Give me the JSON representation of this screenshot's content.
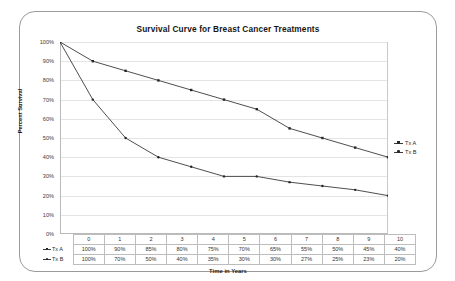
{
  "chart_data": {
    "type": "line",
    "title": "Survival Curve for Breast Cancer Treatments",
    "xlabel": "Time in Years",
    "ylabel": "Percent Survival",
    "categories": [
      "0",
      "1",
      "2",
      "3",
      "4",
      "5",
      "6",
      "7",
      "8",
      "9",
      "10"
    ],
    "x": [
      0,
      1,
      2,
      3,
      4,
      5,
      6,
      7,
      8,
      9,
      10
    ],
    "xlim": [
      0,
      10
    ],
    "ylim": [
      0,
      100
    ],
    "yticks": [
      "0%",
      "10%",
      "20%",
      "30%",
      "40%",
      "50%",
      "60%",
      "70%",
      "80%",
      "90%",
      "100%"
    ],
    "ytick_values": [
      0,
      10,
      20,
      30,
      40,
      50,
      60,
      70,
      80,
      90,
      100
    ],
    "grid": "horizontal",
    "legend_position": "right",
    "series": [
      {
        "name": "Tx A",
        "marker": "square",
        "color": "#333333",
        "values": [
          100,
          90,
          85,
          80,
          75,
          70,
          65,
          55,
          50,
          45,
          40
        ],
        "labels": [
          "100%",
          "90%",
          "85%",
          "80%",
          "75%",
          "70%",
          "65%",
          "55%",
          "50%",
          "45%",
          "40%"
        ]
      },
      {
        "name": "Tx B",
        "marker": "circle",
        "color": "#333333",
        "values": [
          100,
          70,
          50,
          40,
          35,
          30,
          30,
          27,
          25,
          23,
          20
        ],
        "labels": [
          "100%",
          "70%",
          "50%",
          "40%",
          "35%",
          "30%",
          "30%",
          "27%",
          "25%",
          "23%",
          "20%"
        ]
      }
    ]
  },
  "legend": {
    "items": [
      "Tx A",
      "Tx B"
    ]
  }
}
